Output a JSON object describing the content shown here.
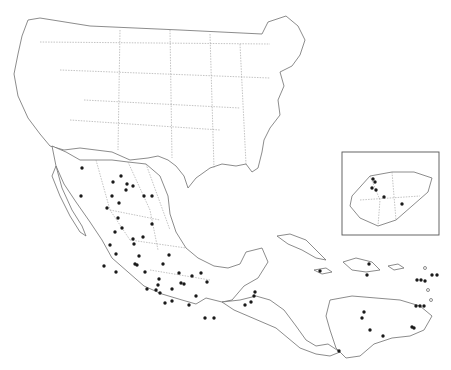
{
  "map": {
    "title": "",
    "region": "North America, Mexico, Central America and Caribbean",
    "colors": {
      "land_stroke": "#6e6e6e",
      "border": "#9a9a9a",
      "dot": "#1a1a1a",
      "background": "#ffffff"
    },
    "inset": {
      "label": "Guatemala inset",
      "x": 342,
      "y": 152,
      "width": 97,
      "height": 83
    },
    "dots": [
      [
        82,
        168
      ],
      [
        113,
        182
      ],
      [
        121,
        176
      ],
      [
        127,
        184
      ],
      [
        126,
        190
      ],
      [
        133,
        186
      ],
      [
        112,
        196
      ],
      [
        107,
        208
      ],
      [
        119,
        203
      ],
      [
        81,
        196
      ],
      [
        144,
        196
      ],
      [
        122,
        228
      ],
      [
        118,
        218
      ],
      [
        133,
        239
      ],
      [
        115,
        232
      ],
      [
        110,
        245
      ],
      [
        152,
        224
      ],
      [
        152,
        196
      ],
      [
        116,
        254
      ],
      [
        143,
        237
      ],
      [
        134,
        244
      ],
      [
        135,
        264
      ],
      [
        104,
        266
      ],
      [
        116,
        272
      ],
      [
        137,
        265
      ],
      [
        159,
        279
      ],
      [
        163,
        264
      ],
      [
        158,
        285
      ],
      [
        179,
        273
      ],
      [
        181,
        283
      ],
      [
        172,
        289
      ],
      [
        165,
        303
      ],
      [
        189,
        305
      ],
      [
        192,
        276
      ],
      [
        196,
        296
      ],
      [
        201,
        273
      ],
      [
        207,
        282
      ],
      [
        205,
        318
      ],
      [
        214,
        318
      ],
      [
        172,
        301
      ],
      [
        169,
        255
      ],
      [
        145,
        272
      ],
      [
        139,
        256
      ],
      [
        147,
        289
      ],
      [
        156,
        290
      ],
      [
        184,
        284
      ],
      [
        160,
        293
      ],
      [
        255,
        292
      ],
      [
        254,
        296
      ],
      [
        251,
        302
      ],
      [
        245,
        305
      ],
      [
        320,
        271
      ],
      [
        369,
        264
      ],
      [
        367,
        275
      ],
      [
        432,
        275
      ],
      [
        437,
        275
      ],
      [
        417,
        280
      ],
      [
        421,
        280
      ],
      [
        425,
        281
      ],
      [
        416,
        306
      ],
      [
        420,
        306
      ],
      [
        424,
        306
      ],
      [
        412,
        327
      ],
      [
        414,
        328
      ],
      [
        362,
        318
      ],
      [
        364,
        312
      ],
      [
        370,
        330
      ],
      [
        383,
        336
      ],
      [
        339,
        351
      ],
      [
        373,
        179
      ],
      [
        375,
        182
      ],
      [
        372,
        188
      ],
      [
        376,
        190
      ],
      [
        384,
        197
      ],
      [
        402,
        204
      ]
    ]
  }
}
